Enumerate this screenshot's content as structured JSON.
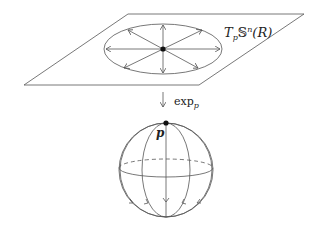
{
  "diagram": {
    "tangent_plane_label": {
      "T": "T",
      "sub_p": "p",
      "S": "𝕊",
      "sup_n": "n",
      "arg": "(R)"
    },
    "map_label": {
      "name": "exp",
      "sub": "p"
    },
    "point_label": "p",
    "colors": {
      "stroke": "#555555",
      "point": "#111111",
      "background": "#ffffff"
    }
  }
}
